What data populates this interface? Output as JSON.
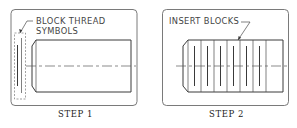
{
  "figure": {
    "panels": [
      {
        "id": "step1",
        "caption": "STEP 1",
        "callout_lines": [
          "BLOCK THREAD",
          "SYMBOLS"
        ]
      },
      {
        "id": "step2",
        "caption": "STEP 2",
        "callout_lines": [
          "INSERT BLOCKS"
        ],
        "inserted_block_count": 6
      }
    ]
  }
}
